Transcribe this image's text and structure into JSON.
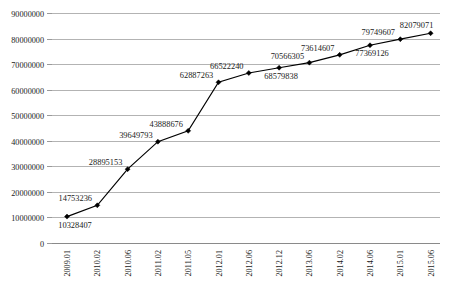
{
  "chart_data": {
    "type": "line",
    "title": "",
    "subtitle": "",
    "xlabel": "",
    "ylabel": "",
    "grid": true,
    "legend": false,
    "legend_position": "none",
    "marker": "diamond",
    "line_color": "#000000",
    "grid_color": "#b3b3b3",
    "text_color": "#1a1a1a",
    "ylim": [
      0,
      90000000
    ],
    "ytick_step": 10000000,
    "categories": [
      "2009.01",
      "2010.02",
      "2010.06",
      "2011.02",
      "2011.05",
      "2012.01",
      "2012.06",
      "2012.12",
      "2013.06",
      "2014.02",
      "2014.06",
      "2015.01",
      "2015.06"
    ],
    "values": [
      10328407,
      14753236,
      28895153,
      39649793,
      43888676,
      62887263,
      66522240,
      68579838,
      70566305,
      73614607,
      77369126,
      79749607,
      82079071
    ],
    "point_labels": [
      "10328407",
      "14753236",
      "28895153",
      "39649793",
      "43888676",
      "62887263",
      "66522240",
      "68579838",
      "70566305",
      "73614607",
      "77369126",
      "79749607",
      "82079071"
    ],
    "point_label_placement": [
      "below",
      "above-left",
      "above-left",
      "above-left",
      "above-left",
      "above-left",
      "above-left",
      "below",
      "above-left",
      "above-left",
      "below",
      "above-left",
      "above-left"
    ],
    "ytick_labels": [
      "0",
      "10000000",
      "20000000",
      "30000000",
      "40000000",
      "50000000",
      "60000000",
      "70000000",
      "80000000",
      "90000000"
    ],
    "ytick_values": [
      0,
      10000000,
      20000000,
      30000000,
      40000000,
      50000000,
      60000000,
      70000000,
      80000000,
      90000000
    ]
  }
}
